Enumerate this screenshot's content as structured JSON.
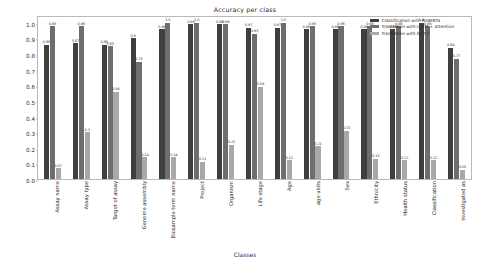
{
  "chart_data": {
    "type": "bar",
    "title": "Accuracy per class",
    "xlabel": "Classes",
    "ylabel": "",
    "ylim": [
      0.0,
      1.05
    ],
    "grid": false,
    "legend_position": "upper right",
    "ytick_labels": [
      "0.0",
      "0.1",
      "0.2",
      "0.3",
      "0.4",
      "0.5",
      "0.6",
      "0.7",
      "0.8",
      "0.9",
      "1.0"
    ],
    "ytick_values": [
      0.0,
      0.1,
      0.2,
      0.3,
      0.4,
      0.5,
      0.6,
      0.7,
      0.8,
      0.9,
      1.0
    ],
    "categories": [
      "Assay name",
      "Assay type",
      "Target of assay",
      "Genome assembly",
      "Biosample term name",
      "Project",
      "Organism",
      "Life stage",
      "Age",
      "age units",
      "Sex",
      "Ethnicity",
      "Health status",
      "Classification",
      "Investigated as"
    ],
    "series": [
      {
        "name": "Classification with RoBERTa",
        "color": "#3f3f3f",
        "values": [
          0.86,
          0.87,
          0.86,
          0.9,
          0.96,
          0.99,
          0.99,
          0.97,
          0.97,
          0.96,
          0.96,
          0.96,
          0.96,
          1.0,
          0.84
        ],
        "labels": [
          "0.86",
          "0.87",
          "0.86",
          "0.9",
          "0.96",
          "0.99",
          "0.99",
          "0.97",
          "0.97",
          "0.96",
          "0.96",
          "0.96",
          "0.96",
          "1.0",
          "0.84"
        ]
      },
      {
        "name": "Translation with LSTM + attention",
        "color": "#6e6e6e",
        "values": [
          0.98,
          0.98,
          0.85,
          0.75,
          1.0,
          1.0,
          0.99,
          0.93,
          1.0,
          0.98,
          0.98,
          0.98,
          0.98,
          0.98,
          0.77
        ],
        "labels": [
          "0.98",
          "0.98",
          "0.85",
          "0.75",
          "1.0",
          "1.0",
          "0.99",
          "0.93",
          "1.0",
          "0.98",
          "0.98",
          "0.98",
          "0.98",
          "0.98",
          "0.77"
        ]
      },
      {
        "name": "Translation with GPT-2",
        "color": "#a8a8a8",
        "values": [
          0.07,
          0.3,
          0.56,
          0.14,
          0.14,
          0.11,
          0.22,
          0.59,
          0.12,
          0.21,
          0.31,
          0.13,
          0.12,
          0.12,
          0.06
        ],
        "labels": [
          "0.07",
          "0.3",
          "0.56",
          "0.14",
          "0.14",
          "0.11",
          "0.22",
          "0.59",
          "0.12",
          "0.21",
          "0.31",
          "0.13",
          "0.12",
          "0.12",
          "0.06"
        ]
      }
    ]
  },
  "legend": {
    "items": [
      {
        "label": "Classification with RoBERTa",
        "color": "#3f3f3f"
      },
      {
        "label": "Translation with LSTM + attention",
        "color": "#6e6e6e"
      },
      {
        "label": "Translation with GPT-2",
        "color": "#a8a8a8"
      }
    ]
  }
}
